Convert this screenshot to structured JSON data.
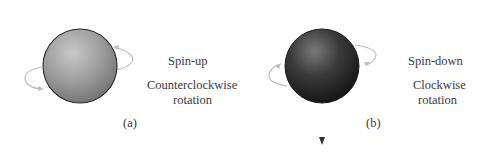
{
  "panels": [
    {
      "id": "a",
      "caption": "(a)",
      "spin_label": "Spin-up",
      "rotation_label_line1": "Counterclockwise",
      "rotation_label_line2": "rotation",
      "sphere_color": "#8c8c8c",
      "arrow_direction": "up"
    },
    {
      "id": "b",
      "caption": "(b)",
      "spin_label": "Spin-down",
      "rotation_label_line1": "Clockwise",
      "rotation_label_line2": "rotation",
      "sphere_color": "#2e2e2e",
      "arrow_direction": "down"
    }
  ],
  "colors": {
    "rotation_arrow": "#bdbdbd",
    "axis_line": "#555555"
  }
}
